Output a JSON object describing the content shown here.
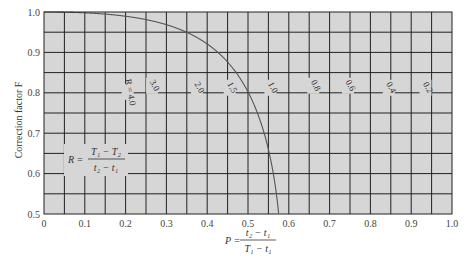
{
  "chart_data": {
    "type": "line",
    "title": "",
    "xlabel": "P = (t2 − t1) / (T1 − t1)",
    "ylabel": "Correction factor F",
    "xlim": [
      0,
      1.0
    ],
    "ylim": [
      0.5,
      1.0
    ],
    "grid": true,
    "x_ticks": [
      "0",
      "0.1",
      "0.2",
      "0.3",
      "0.4",
      "0.5",
      "0.6",
      "0.7",
      "0.8",
      "0.9",
      "1.0"
    ],
    "y_ticks": [
      "0.5",
      "0.6",
      "0.7",
      "0.8",
      "0.9",
      "1.0"
    ],
    "annotation": "R = (T1 − T2) / (t2 − t1)",
    "series": [
      {
        "name": "R = 4.0",
        "R": 4.0,
        "label": "R = 4.0"
      },
      {
        "name": "3.0",
        "R": 3.0,
        "label": "3.0"
      },
      {
        "name": "2.0",
        "R": 2.0,
        "label": "2.0"
      },
      {
        "name": "1.5",
        "R": 1.5,
        "label": "1.5"
      },
      {
        "name": "1.0",
        "R": 1.0,
        "label": "1.0"
      },
      {
        "name": "0.8",
        "R": 0.8,
        "label": "0.8"
      },
      {
        "name": "0.6",
        "R": 0.6,
        "label": "0.6"
      },
      {
        "name": "0.4",
        "R": 0.4,
        "label": "0.4"
      },
      {
        "name": "0.2",
        "R": 0.2,
        "label": "0.2"
      }
    ],
    "label_positions": [
      {
        "P": 0.205,
        "F": 0.8
      },
      {
        "P": 0.265,
        "F": 0.815
      },
      {
        "P": 0.375,
        "F": 0.81
      },
      {
        "P": 0.455,
        "F": 0.81
      },
      {
        "P": 0.555,
        "F": 0.81
      },
      {
        "P": 0.66,
        "F": 0.815
      },
      {
        "P": 0.745,
        "F": 0.815
      },
      {
        "P": 0.845,
        "F": 0.81
      },
      {
        "P": 0.935,
        "F": 0.81
      }
    ]
  },
  "axis": {
    "ylabel": "Correction factor F",
    "xlabel_lhs": "P =",
    "xlabel_num": "t₂ − t₁",
    "xlabel_den": "T₁ − t₁",
    "r_lhs": "R =",
    "r_num": "T₁ − T₂",
    "r_den": "t₂ − t₁"
  }
}
